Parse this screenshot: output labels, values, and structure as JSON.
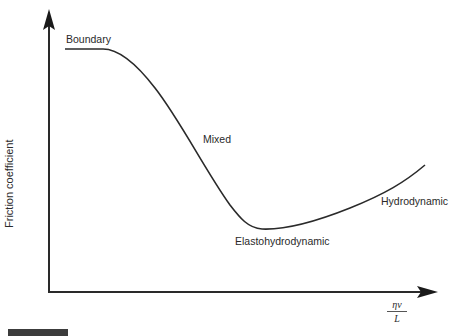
{
  "diagram": {
    "y_axis_label": "Friction coefficient",
    "x_axis_label": {
      "numerator": "ηv",
      "denominator": "L"
    },
    "regions": [
      {
        "label": "Boundary"
      },
      {
        "label": "Mixed"
      },
      {
        "label": "Elastohydrodynamic"
      },
      {
        "label": "Hydrodynamic"
      }
    ],
    "colors": {
      "line": "#2a2a2a",
      "text": "#2a2a2a",
      "footer_bar": "#3c3c3c"
    }
  }
}
